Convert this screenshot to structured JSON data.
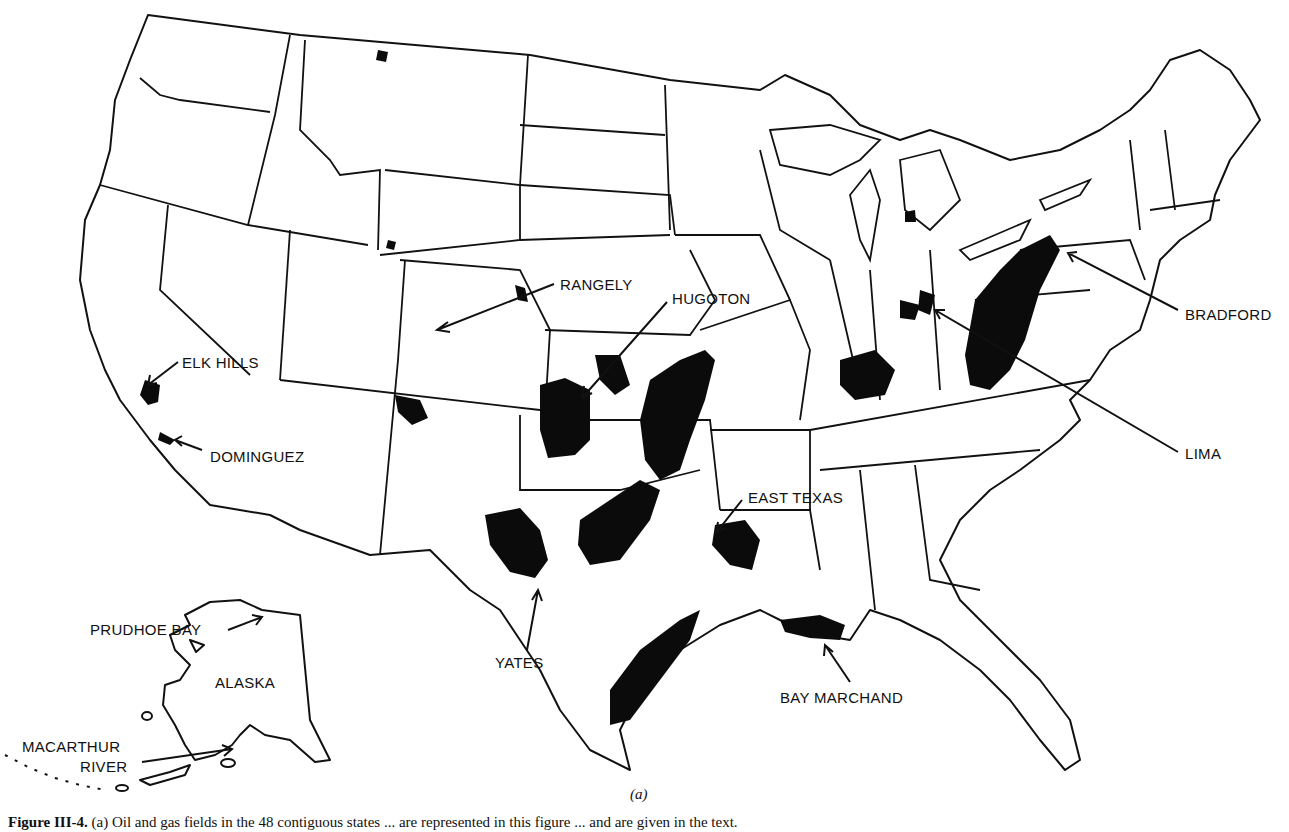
{
  "figure": {
    "sublabel": "(a)",
    "caption_number": "Figure III-4.",
    "caption_text": "(a) Oil and gas fields in the 48 contiguous states ... are represented in this figure ... and are given in the text."
  },
  "map": {
    "region": "United States (48 contiguous states) with Alaska inset",
    "field_color": "#0b0b0b",
    "border_color": "#111111",
    "background": "#ffffff",
    "inset_label": "ALASKA",
    "fields": [
      {
        "id": "prudhoe",
        "label": "PRUDHOE BAY"
      },
      {
        "id": "macarthur",
        "label_line1": "MACARTHUR",
        "label_line2": "RIVER"
      },
      {
        "id": "elk",
        "label": "ELK HILLS"
      },
      {
        "id": "dominguez",
        "label": "DOMINGUEZ"
      },
      {
        "id": "rangely",
        "label": "RANGELY"
      },
      {
        "id": "hugoton",
        "label": "HUGOTON"
      },
      {
        "id": "easttexas",
        "label": "EAST TEXAS"
      },
      {
        "id": "yates",
        "label": "YATES"
      },
      {
        "id": "baymarchand",
        "label": "BAY MARCHAND"
      },
      {
        "id": "lima",
        "label": "LIMA"
      },
      {
        "id": "bradford",
        "label": "BRADFORD"
      }
    ]
  }
}
